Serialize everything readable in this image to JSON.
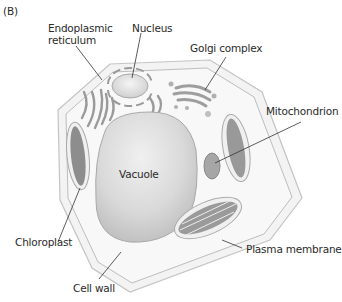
{
  "figure": {
    "panel_label": "(B)",
    "labels": {
      "er_line1": "Endoplasmic",
      "er_line2": "reticulum",
      "nucleus": "Nucleus",
      "golgi": "Golgi complex",
      "mitochondrion": "Mitochondrion",
      "vacuole": "Vacuole",
      "chloroplast": "Chloroplast",
      "plasma_membrane": "Plasma membrane",
      "cell_wall": "Cell wall"
    },
    "colors": {
      "cell_wall_fill": "#f4f4f4",
      "cell_wall_stroke": "#c8c8c8",
      "cytoplasm_fill": "#f7f7f7",
      "vacuole_fill": "#d6d6d6",
      "organelle_fill": "#a8a8a8",
      "leader_line": "#333333"
    }
  }
}
